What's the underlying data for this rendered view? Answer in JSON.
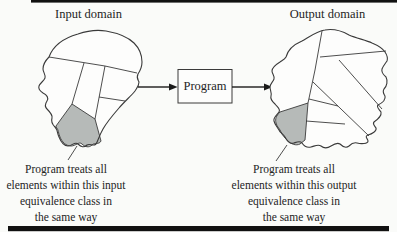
{
  "titles": {
    "input": "Input domain",
    "output": "Output domain"
  },
  "program_box": {
    "label": "Program"
  },
  "captions": {
    "input": {
      "lines": [
        "Program treats all",
        "elements within this input",
        "equivalence class in",
        "the same way"
      ]
    },
    "output": {
      "lines": [
        "Program treats all",
        "elements within this output",
        "equivalence class in",
        "the same way"
      ]
    }
  },
  "colors": {
    "background": "#fafbf9",
    "head_fill": "#fdfdfc",
    "shaded_region": "#b6bab8",
    "line": "#3a3a3a",
    "arrow": "#1a1a1a",
    "text": "#242424",
    "rule": "#111111"
  }
}
